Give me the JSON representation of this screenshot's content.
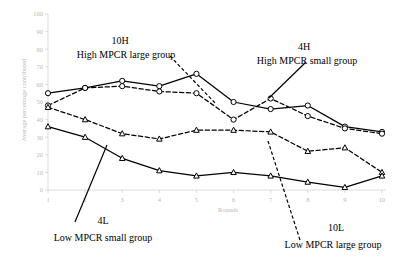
{
  "chart_data": {
    "type": "line",
    "title": "",
    "xlabel": "Rounds",
    "ylabel": "Average percentage contributed",
    "x": [
      1,
      2,
      3,
      4,
      5,
      6,
      7,
      8,
      9,
      10
    ],
    "xtick_labels": [
      "1",
      "2",
      "3",
      "4",
      "5",
      "6",
      "7",
      "8",
      "9",
      "10"
    ],
    "ytick_labels": [
      "0",
      "10",
      "20",
      "30",
      "40",
      "50",
      "60",
      "70",
      "80",
      "90",
      "100"
    ],
    "ylim": [
      0,
      100
    ],
    "xlim": [
      1,
      10
    ],
    "grid": false,
    "legend_position": "annotations-inline",
    "series": [
      {
        "name": "4H",
        "description": "High MPCR small group",
        "line_style": "solid",
        "marker": "circle",
        "values": [
          55,
          58,
          62,
          59,
          66,
          50,
          46,
          48,
          36,
          33
        ]
      },
      {
        "name": "10H",
        "description": "High MPCR large group",
        "line_style": "dashed",
        "marker": "circle",
        "values": [
          48,
          58,
          59,
          56,
          55,
          40,
          52,
          42,
          35,
          32
        ]
      },
      {
        "name": "10L",
        "description": "Low MPCR large group",
        "line_style": "dashed",
        "marker": "triangle",
        "values": [
          47,
          40,
          32,
          29,
          34,
          34,
          33,
          22,
          24,
          10
        ]
      },
      {
        "name": "4L",
        "description": "Low MPCR small group",
        "line_style": "solid",
        "marker": "triangle",
        "values": [
          36,
          30,
          18,
          11,
          8,
          10,
          8,
          4.5,
          1.5,
          8
        ]
      }
    ],
    "annotations": [
      {
        "id": "annot-10h",
        "code": "10H",
        "desc": "High MPCR large group",
        "code_x": 120,
        "code_y": 35,
        "desc_x": 126,
        "desc_y": 49,
        "leader_style": "dashed"
      },
      {
        "id": "annot-4h",
        "code": "4H",
        "desc": "High MPCR small group",
        "code_x": 304,
        "code_y": 41,
        "desc_x": 307,
        "desc_y": 55,
        "leader_style": "solid"
      },
      {
        "id": "annot-4l",
        "code": "4L",
        "desc": "Low MPCR small group",
        "code_x": 103,
        "code_y": 215,
        "desc_x": 103,
        "desc_y": 232,
        "leader_style": "solid"
      },
      {
        "id": "annot-10l",
        "code": "10L",
        "desc": "Low MPCR large group",
        "code_x": 336,
        "code_y": 222,
        "desc_x": 333,
        "desc_y": 239,
        "leader_style": "dashed"
      }
    ]
  }
}
